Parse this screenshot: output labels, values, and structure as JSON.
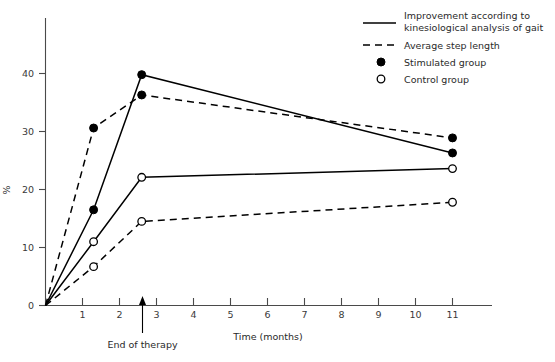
{
  "chart_data": {
    "type": "line",
    "title": "",
    "xlabel": "Time (months)",
    "ylabel": "%",
    "xlim": [
      0,
      11.6
    ],
    "ylim": [
      0,
      47
    ],
    "grid": false,
    "x_ticks": [
      0,
      1,
      2,
      3,
      4,
      5,
      6,
      7,
      8,
      9,
      10,
      11
    ],
    "x_tick_labels": [
      "0",
      "1",
      "2",
      "3",
      "4",
      "5",
      "6",
      "7",
      "8",
      "9",
      "10",
      "11"
    ],
    "y_ticks": [
      0,
      10,
      20,
      30,
      40
    ],
    "y_tick_labels": [
      "0",
      "10",
      "20",
      "30",
      "40"
    ],
    "legend_position": "top-right",
    "x": [
      0,
      1.3,
      2.6,
      11
    ],
    "series": [
      {
        "name": "Improvement according to kinesiological analysis of gait — Stimulated group",
        "line_style": "solid",
        "marker": "filled-circle",
        "values": [
          0,
          16.5,
          39.8,
          26.3
        ]
      },
      {
        "name": "Average step length — Stimulated group",
        "line_style": "dashed",
        "marker": "filled-circle",
        "values": [
          0,
          30.6,
          36.3,
          28.9
        ]
      },
      {
        "name": "Improvement according to kinesiological analysis of gait — Control group",
        "line_style": "solid",
        "marker": "open-circle",
        "values": [
          0,
          11.0,
          22.1,
          23.6
        ]
      },
      {
        "name": "Average step length — Control group",
        "line_style": "dashed",
        "marker": "open-circle",
        "values": [
          0,
          6.7,
          14.5,
          17.8
        ]
      }
    ],
    "annotations": [
      {
        "text": "End of therapy",
        "x": 2.6,
        "y": 0,
        "type": "arrow-up"
      }
    ],
    "legend_entries": [
      {
        "label_line1": "Improvement according to",
        "label_line2": "kinesiological analysis of gait",
        "symbol": "solid-line"
      },
      {
        "label_line1": "Average step length",
        "label_line2": "",
        "symbol": "dashed-line"
      },
      {
        "label_line1": "Stimulated group",
        "label_line2": "",
        "symbol": "filled-circle"
      },
      {
        "label_line1": "Control group",
        "label_line2": "",
        "symbol": "open-circle"
      }
    ]
  },
  "axes": {
    "x_title": "Time (months)",
    "y_title": "%"
  },
  "colors": {
    "line": "#000000",
    "axis": "#4a4a4a",
    "text": "#2a2a2a",
    "background": "#ffffff"
  }
}
